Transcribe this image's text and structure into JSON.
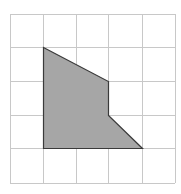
{
  "grid": {
    "x_lines": [
      10,
      43,
      76,
      108,
      142,
      175
    ],
    "y_lines": [
      14,
      47,
      81,
      115,
      148,
      183
    ],
    "line_color": "#c8c8c8",
    "cols": 5,
    "rows": 5
  },
  "shape": {
    "name": "shaded-polygon",
    "vertices_grid": [
      [
        1,
        1
      ],
      [
        3,
        2
      ],
      [
        3,
        3
      ],
      [
        4,
        4
      ],
      [
        1,
        4
      ]
    ],
    "fill": "#a6a6a6",
    "stroke": "#3a3a3a"
  }
}
